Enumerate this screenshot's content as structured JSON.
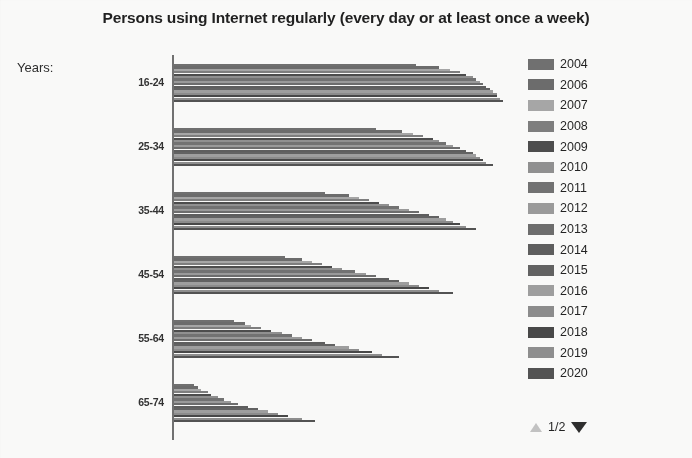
{
  "chart_title": "Persons using Internet regularly (every day or at least once a week)",
  "axis_group_label": "Years:",
  "legend": {
    "entries": [
      {
        "label": "2004",
        "color": "#6e6e6e"
      },
      {
        "label": "2006",
        "color": "#6a6a6a"
      },
      {
        "label": "2007",
        "color": "#a6a6a6"
      },
      {
        "label": "2008",
        "color": "#7d7d7d"
      },
      {
        "label": "2009",
        "color": "#4a4a4a"
      },
      {
        "label": "2010",
        "color": "#8f8f8f"
      },
      {
        "label": "2011",
        "color": "#707070"
      },
      {
        "label": "2012",
        "color": "#9a9a9a"
      },
      {
        "label": "2013",
        "color": "#6b6b6b"
      },
      {
        "label": "2014",
        "color": "#5c5c5c"
      },
      {
        "label": "2015",
        "color": "#606060"
      },
      {
        "label": "2016",
        "color": "#9e9e9e"
      },
      {
        "label": "2017",
        "color": "#8b8b8b"
      },
      {
        "label": "2018",
        "color": "#454545"
      },
      {
        "label": "2019",
        "color": "#8d8d8d"
      },
      {
        "label": "2020",
        "color": "#505050"
      }
    ],
    "pager": {
      "up_icon": "triangle-up-icon",
      "down_icon": "triangle-down-icon",
      "text": "1/2"
    }
  },
  "chart_data": {
    "type": "bar",
    "orientation": "horizontal",
    "title": "Persons using Internet regularly (every day or at least once a week)",
    "xlabel": "",
    "ylabel": "Years:",
    "grid": false,
    "legend_position": "right",
    "xlim": [
      0,
      100
    ],
    "categories": [
      "16-24",
      "25-34",
      "35-44",
      "45-54",
      "55-64",
      "65-74"
    ],
    "series": [
      {
        "name": "2004",
        "values": [
          72,
          60,
          45,
          33,
          18,
          6
        ]
      },
      {
        "name": "2006",
        "values": [
          79,
          68,
          52,
          38,
          21,
          7
        ]
      },
      {
        "name": "2007",
        "values": [
          82,
          71,
          55,
          41,
          23,
          8
        ]
      },
      {
        "name": "2008",
        "values": [
          85,
          74,
          58,
          44,
          26,
          10
        ]
      },
      {
        "name": "2009",
        "values": [
          87,
          77,
          61,
          47,
          29,
          11
        ]
      },
      {
        "name": "2010",
        "values": [
          89,
          79,
          64,
          50,
          32,
          13
        ]
      },
      {
        "name": "2011",
        "values": [
          90,
          81,
          67,
          54,
          35,
          15
        ]
      },
      {
        "name": "2012",
        "values": [
          91,
          83,
          70,
          57,
          38,
          17
        ]
      },
      {
        "name": "2013",
        "values": [
          92,
          85,
          73,
          60,
          41,
          19
        ]
      },
      {
        "name": "2014",
        "values": [
          93,
          87,
          76,
          64,
          45,
          22
        ]
      },
      {
        "name": "2015",
        "values": [
          94,
          89,
          79,
          67,
          48,
          25
        ]
      },
      {
        "name": "2016",
        "values": [
          95,
          90,
          81,
          70,
          52,
          28
        ]
      },
      {
        "name": "2017",
        "values": [
          96,
          91,
          83,
          73,
          55,
          31
        ]
      },
      {
        "name": "2018",
        "values": [
          96,
          92,
          85,
          76,
          59,
          34
        ]
      },
      {
        "name": "2019",
        "values": [
          97,
          93,
          87,
          79,
          62,
          38
        ]
      },
      {
        "name": "2020",
        "values": [
          98,
          95,
          90,
          83,
          67,
          42
        ]
      }
    ]
  }
}
